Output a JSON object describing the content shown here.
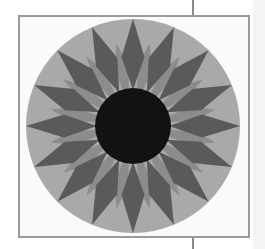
{
  "image": {
    "subject": "quilt-block-star-pattern",
    "points": 16,
    "colors": {
      "outer_ring": "#a8a8a8",
      "dark_points": "#5a5a5a",
      "light_points": "#8c8c8c",
      "center": "#111111",
      "frame": "#9a9a9a"
    }
  }
}
